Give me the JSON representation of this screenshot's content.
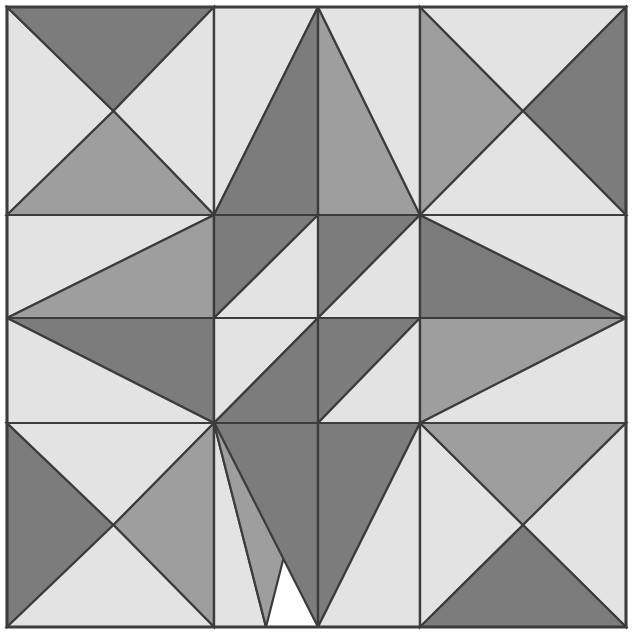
{
  "artwork": {
    "title": "Geometric Quilt Block Pattern",
    "kind": "tessellated-triangle-mosaic",
    "canvas": {
      "width": 636,
      "height": 641
    },
    "background_color": "#ffffff"
  },
  "palette": {
    "light": "#e2e3e2",
    "medium": "#9d9e9d",
    "dark": "#7b7c7b",
    "outline": "#3c3c3c",
    "outline_width": 2.2,
    "border": "#3c3c3c",
    "border_width": 3
  },
  "layout": {
    "frame": {
      "x0": 7,
      "y0": 7,
      "x1": 626,
      "y1": 627
    },
    "columns_x": [
      7,
      214,
      318,
      420,
      626
    ],
    "rows_y": [
      7,
      215,
      318,
      423,
      627
    ],
    "grid_major": {
      "cols": 3,
      "rows": 3
    },
    "cell_width": 206,
    "cell_height": 207
  },
  "shapes": [
    {
      "name": "tl-left-light",
      "fill": "light",
      "points": "7,7 113.5,111 7,215"
    },
    {
      "name": "tl-top-dark",
      "fill": "dark",
      "points": "7,7 214,7 113.5,111"
    },
    {
      "name": "tl-right-light",
      "fill": "light",
      "points": "214,7 214,215 113.5,111"
    },
    {
      "name": "tl-bottom-medium",
      "fill": "medium",
      "points": "7,215 113.5,111 214,215"
    },
    {
      "name": "tm-a-light",
      "fill": "light",
      "points": "214,7 318,7 214,215"
    },
    {
      "name": "tm-a-dark",
      "fill": "dark",
      "points": "318,7 318,215 214,215"
    },
    {
      "name": "tm-b-medium",
      "fill": "medium",
      "points": "318,7 318,215 420,215"
    },
    {
      "name": "tm-b-light",
      "fill": "light",
      "points": "318,7 420,215 420,7"
    },
    {
      "name": "tr-left-medium",
      "fill": "medium",
      "points": "420,7 523,111 420,215"
    },
    {
      "name": "tr-top-light",
      "fill": "light",
      "points": "420,7 626,7 523,111"
    },
    {
      "name": "tr-right-dark",
      "fill": "dark",
      "points": "626,7 626,215 523,111"
    },
    {
      "name": "tr-bottom-light",
      "fill": "light",
      "points": "420,215 523,111 626,215"
    },
    {
      "name": "ml-upper-light",
      "fill": "light",
      "points": "7,215 214,215 7,318"
    },
    {
      "name": "ml-upper-medium",
      "fill": "medium",
      "points": "214,215 214,318 7,318"
    },
    {
      "name": "ml-lower-dark",
      "fill": "dark",
      "points": "7,318 214,318 214,423"
    },
    {
      "name": "ml-lower-light",
      "fill": "light",
      "points": "7,318 214,423 7,423"
    },
    {
      "name": "mc-q1-dark",
      "fill": "dark",
      "points": "214,215 214,318 318,215"
    },
    {
      "name": "mc-q1-light",
      "fill": "light",
      "points": "318,215 214,318 318,318"
    },
    {
      "name": "mc-q2-dark",
      "fill": "dark",
      "points": "318,215 420,215 318,318"
    },
    {
      "name": "mc-q2-light",
      "fill": "light",
      "points": "420,215 420,318 318,318"
    },
    {
      "name": "mc-q3-light",
      "fill": "light",
      "points": "214,318 318,318 214,423"
    },
    {
      "name": "mc-q3-dark",
      "fill": "dark",
      "points": "318,318 318,423 214,423"
    },
    {
      "name": "mc-q4-dark",
      "fill": "dark",
      "points": "318,318 420,318 318,423"
    },
    {
      "name": "mc-q4-light",
      "fill": "light",
      "points": "420,318 420,423 318,423"
    },
    {
      "name": "mr-upper-dark",
      "fill": "dark",
      "points": "420,215 626,318 420,318"
    },
    {
      "name": "mr-upper-light",
      "fill": "light",
      "points": "420,215 626,215 626,318"
    },
    {
      "name": "mr-lower-medium",
      "fill": "medium",
      "points": "420,318 626,318 420,423"
    },
    {
      "name": "mr-lower-light",
      "fill": "light",
      "points": "626,318 626,423 420,423"
    },
    {
      "name": "bl-left-dark",
      "fill": "dark",
      "points": "7,423 113.5,525 7,627"
    },
    {
      "name": "bl-top-light",
      "fill": "light",
      "points": "7,423 214,423 113.5,525"
    },
    {
      "name": "bl-right-medium",
      "fill": "medium",
      "points": "214,423 214,627 113.5,525"
    },
    {
      "name": "bl-bottom-light",
      "fill": "light",
      "points": "7,627 113.5,525 214,627"
    },
    {
      "name": "bm-a-light",
      "fill": "light",
      "points": "214,423 214,627 266,627"
    },
    {
      "name": "bm-a-medium",
      "fill": "medium",
      "points": "214,423 318,423 266,627"
    },
    {
      "name": "bm-b-dark",
      "fill": "dark",
      "points": "318,423 318,627 214.5,423"
    },
    {
      "name": "bm-b-dark2",
      "fill": "dark",
      "points": "318,423 420,423 318,627"
    },
    {
      "name": "bm-b-light",
      "fill": "light",
      "points": "420,423 420,627 318,627"
    },
    {
      "name": "br-left-light",
      "fill": "light",
      "points": "420,423 523,525 420,627"
    },
    {
      "name": "br-top-medium",
      "fill": "medium",
      "points": "420,423 626,423 523,525"
    },
    {
      "name": "br-right-light",
      "fill": "light",
      "points": "626,423 626,627 523,525"
    },
    {
      "name": "br-bottom-dark",
      "fill": "dark",
      "points": "420,627 523,525 626,627"
    }
  ],
  "grid_lines": [
    {
      "name": "v-line-1",
      "x1": 214,
      "y1": 7,
      "x2": 214,
      "y2": 627
    },
    {
      "name": "v-line-2",
      "x1": 318,
      "y1": 7,
      "x2": 318,
      "y2": 215
    },
    {
      "name": "v-line-3",
      "x1": 318,
      "y1": 423,
      "x2": 318,
      "y2": 627
    },
    {
      "name": "v-line-4",
      "x1": 420,
      "y1": 7,
      "x2": 420,
      "y2": 627
    },
    {
      "name": "h-line-1",
      "x1": 7,
      "y1": 215,
      "x2": 626,
      "y2": 215
    },
    {
      "name": "h-line-2",
      "x1": 7,
      "y1": 318,
      "x2": 626,
      "y2": 318
    },
    {
      "name": "h-line-3",
      "x1": 7,
      "y1": 423,
      "x2": 626,
      "y2": 423
    }
  ]
}
